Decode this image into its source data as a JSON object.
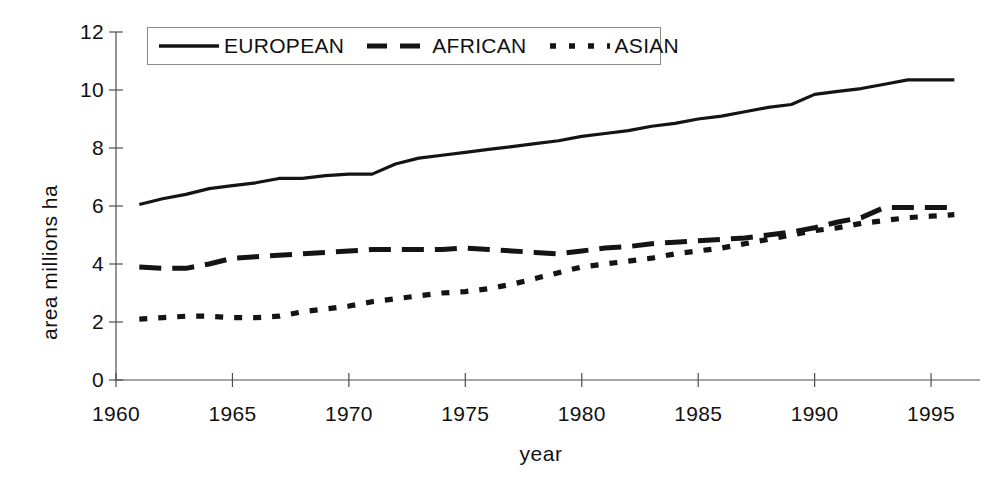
{
  "chart_data": {
    "type": "line",
    "title": "",
    "xlabel": "year",
    "ylabel": "area  millions ha",
    "xlim": [
      1960,
      1996.5
    ],
    "ylim": [
      0,
      12
    ],
    "xticks": [
      1960,
      1965,
      1970,
      1975,
      1980,
      1985,
      1990,
      1995
    ],
    "xtick_labels": [
      "1960",
      "1965",
      "1970",
      "1975",
      "1980",
      "1985",
      "1990",
      "1995"
    ],
    "yticks": [
      0,
      2,
      4,
      6,
      8,
      10,
      12
    ],
    "ytick_labels": [
      "0",
      "2",
      "4",
      "6",
      "8",
      "10",
      "12"
    ],
    "grid": false,
    "legend_position": "top-center",
    "x": [
      1961,
      1962,
      1963,
      1964,
      1965,
      1966,
      1967,
      1968,
      1969,
      1970,
      1971,
      1972,
      1973,
      1974,
      1975,
      1976,
      1977,
      1978,
      1979,
      1980,
      1981,
      1982,
      1983,
      1984,
      1985,
      1986,
      1987,
      1988,
      1989,
      1990,
      1991,
      1992,
      1993,
      1994,
      1995,
      1996
    ],
    "series": [
      {
        "name": "EUROPEAN",
        "style": "solid",
        "color": "#141414",
        "values": [
          6.05,
          6.25,
          6.4,
          6.6,
          6.7,
          6.8,
          6.95,
          6.95,
          7.05,
          7.1,
          7.1,
          7.45,
          7.65,
          7.75,
          7.85,
          7.95,
          8.05,
          8.15,
          8.25,
          8.4,
          8.5,
          8.6,
          8.75,
          8.85,
          9.0,
          9.1,
          9.25,
          9.4,
          9.5,
          9.85,
          9.95,
          10.05,
          10.2,
          10.35,
          10.35,
          10.35
        ]
      },
      {
        "name": "AFRICAN",
        "style": "dashed",
        "color": "#141414",
        "values": [
          3.9,
          3.85,
          3.85,
          4.0,
          4.2,
          4.25,
          4.3,
          4.35,
          4.4,
          4.45,
          4.5,
          4.5,
          4.5,
          4.5,
          4.55,
          4.5,
          4.45,
          4.4,
          4.35,
          4.45,
          4.55,
          4.6,
          4.7,
          4.75,
          4.8,
          4.85,
          4.9,
          5.0,
          5.1,
          5.25,
          5.45,
          5.6,
          5.95,
          5.95,
          5.95,
          5.95
        ]
      },
      {
        "name": "ASIAN",
        "style": "dotted",
        "color": "#141414",
        "values": [
          2.1,
          2.15,
          2.2,
          2.2,
          2.15,
          2.15,
          2.2,
          2.35,
          2.45,
          2.55,
          2.7,
          2.8,
          2.9,
          3.0,
          3.05,
          3.15,
          3.3,
          3.5,
          3.7,
          3.9,
          4.0,
          4.1,
          4.2,
          4.35,
          4.45,
          4.55,
          4.7,
          4.85,
          5.0,
          5.15,
          5.25,
          5.4,
          5.5,
          5.6,
          5.65,
          5.7
        ]
      }
    ]
  },
  "legend": {
    "entries": [
      {
        "label": "EUROPEAN",
        "style": "solid"
      },
      {
        "label": "AFRICAN",
        "style": "dashed"
      },
      {
        "label": "ASIAN",
        "style": "dotted"
      }
    ]
  },
  "axes": {
    "x_axis_title": "year",
    "y_axis_title": "area  millions ha"
  }
}
